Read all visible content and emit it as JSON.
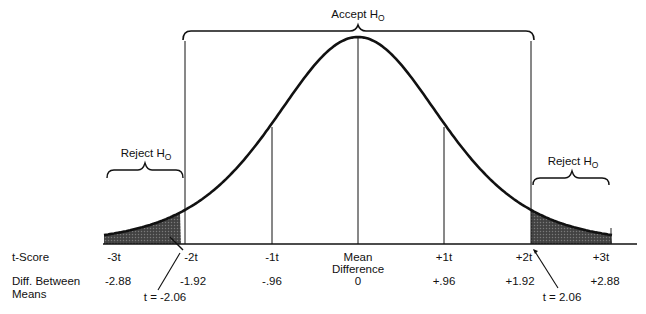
{
  "diagram": {
    "type": "t-distribution hypothesis test",
    "accept_region": {
      "label": "Accept H",
      "subscript": "O"
    },
    "reject_left": {
      "label": "Reject H",
      "subscript": "O"
    },
    "reject_right": {
      "label": "Reject H",
      "subscript": "O"
    },
    "rows": {
      "t_score": {
        "label": "t-Score",
        "ticks": [
          "-3t",
          "-2t",
          "-1t",
          "Mean",
          "+1t",
          "+2t",
          "+3t"
        ],
        "center_sublabel": "Difference"
      },
      "diff_between_means": {
        "label_line1": "Diff. Between",
        "label_line2": "Means",
        "values": [
          "-2.88",
          "-1.92",
          "-.96",
          "0",
          "+.96",
          "+1.92",
          "+2.88"
        ]
      }
    },
    "critical_values": {
      "left": "t = -2.06",
      "right": "t = 2.06"
    }
  },
  "colors": {
    "ink": "#111111",
    "shade": "#3a3a3a",
    "background": "#ffffff"
  }
}
